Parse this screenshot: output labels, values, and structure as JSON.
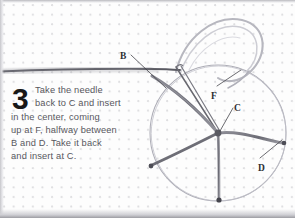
{
  "figure": {
    "step_number": "3",
    "instruction_lines": [
      "Take the needle",
      "back to C and insert",
      "in the center, coming",
      "up at F, halfway between",
      "B and D. Take it back",
      "and insert at C."
    ],
    "instruction_text": "Take the needle back to C and insert in the center, coming up at F, halfway between B and D. Take it back and insert at C.",
    "labels": [
      {
        "id": "label-b",
        "text": "B",
        "x": 120,
        "y": 51
      },
      {
        "id": "label-f",
        "text": "F",
        "x": 211,
        "y": 91
      },
      {
        "id": "label-c",
        "text": "C",
        "x": 234,
        "y": 103
      },
      {
        "id": "label-d",
        "text": "D",
        "x": 258,
        "y": 163
      }
    ],
    "colors": {
      "paper": "#fdfdfd",
      "grid_dot": "#96969e",
      "pencil_line": "#6e6e76",
      "thread_light": "#b4b4bc",
      "needle_dark": "#55555c",
      "text": "#58585e",
      "number": "#181818",
      "label": "#2e2e33"
    },
    "diagram": {
      "type": "spider-web-stitch",
      "circle_center_x": 218,
      "circle_center_y": 133,
      "circle_radius": 68,
      "spokes": [
        {
          "name": "spoke-to-b-upper-left",
          "end_x": 143,
          "end_y": 74
        },
        {
          "name": "spoke-left-lower",
          "end_x": 151,
          "end_y": 166
        },
        {
          "name": "spoke-bottom",
          "end_x": 219,
          "end_y": 201
        },
        {
          "name": "spoke-right",
          "end_x": 284,
          "end_y": 143
        }
      ]
    }
  }
}
